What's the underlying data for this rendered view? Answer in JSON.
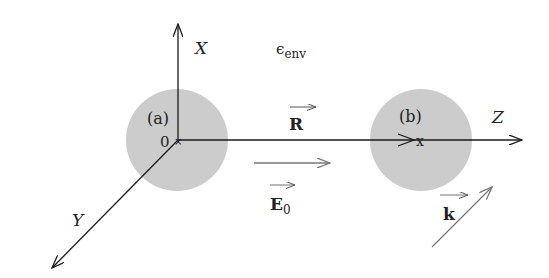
{
  "diagram": {
    "environment_label": "ϵ",
    "environment_subscript": "env",
    "axes": {
      "x_label": "X",
      "y_label": "Y",
      "z_label": "Z",
      "origin_label": "0"
    },
    "spheres": [
      {
        "id": "a",
        "label": "(a)",
        "fill": "#cccccc"
      },
      {
        "id": "b",
        "label": "(b)",
        "fill": "#cccccc",
        "marker": "x"
      }
    ],
    "vectors": {
      "R_label": "R",
      "E0_label": "E",
      "E0_subscript": "0",
      "k_label": "k"
    },
    "colors": {
      "axis": "#1a1a1a",
      "sphere": "#cccccc",
      "field_arrow": "#777777",
      "text": "#222222"
    }
  }
}
